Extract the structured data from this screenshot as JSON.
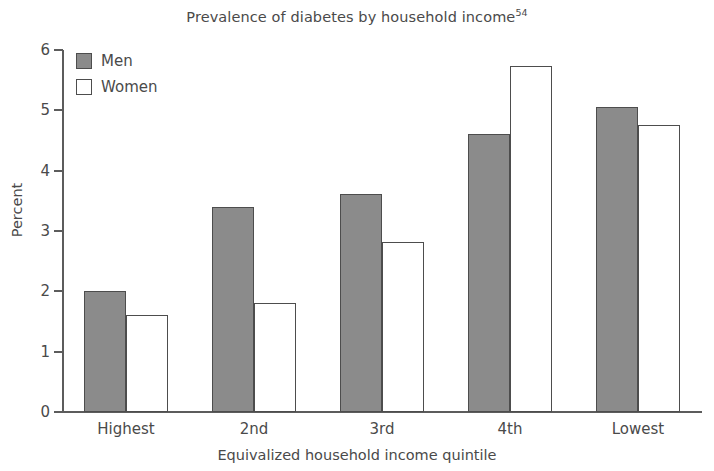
{
  "chart_data": {
    "type": "bar",
    "title": "Prevalence of diabetes by household income",
    "title_superscript": "54",
    "xlabel": "Equivalized household income quintile",
    "ylabel": "Percent",
    "categories": [
      "Highest",
      "2nd",
      "3rd",
      "4th",
      "Lowest"
    ],
    "series": [
      {
        "name": "Men",
        "values": [
          2.0,
          3.4,
          3.62,
          4.6,
          5.05
        ],
        "color": "#8b8b8b"
      },
      {
        "name": "Women",
        "values": [
          1.6,
          1.8,
          2.82,
          5.73,
          4.75
        ],
        "color": "#ffffff"
      }
    ],
    "ylim": [
      0,
      6
    ],
    "yticks": [
      0,
      1,
      2,
      3,
      4,
      5,
      6
    ],
    "ytick_labels": [
      "0",
      "1",
      "2",
      "3",
      "4",
      "5",
      "6"
    ],
    "grid": false,
    "legend_position": "top-left",
    "axis_color": "#5c5c5c",
    "bar_border_color": "#4d4d4d",
    "text_color": "#4a4a4a"
  },
  "legend": {
    "items": [
      {
        "label": "Men"
      },
      {
        "label": "Women"
      }
    ]
  }
}
